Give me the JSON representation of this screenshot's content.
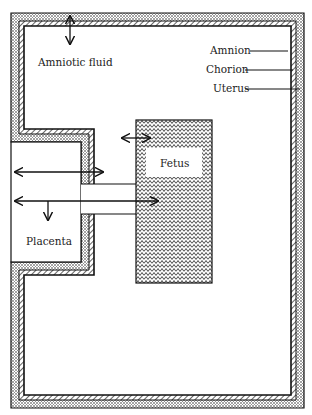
{
  "diagram": {
    "type": "schematic",
    "colors": {
      "background": "#ffffff",
      "line": "#111111",
      "uterus_fill": "stipple",
      "chorion_fill": "diagonal-hatch",
      "fetus_fill": "zigzag-hatch"
    },
    "labels": {
      "amniotic_fluid": "Amniotic fluid",
      "amnion": "Amnion",
      "chorion": "Chorion",
      "uterus": "Uterus",
      "fetus": "Fetus",
      "placenta": "Placenta"
    },
    "arrows": [
      {
        "id": "fluid-exchange",
        "type": "double",
        "direction": "vertical",
        "between": [
          "Uterus wall",
          "Amniotic fluid"
        ]
      },
      {
        "id": "fetus-fluid",
        "type": "double",
        "direction": "horizontal",
        "between": [
          "Amniotic fluid",
          "Fetus"
        ]
      },
      {
        "id": "placenta-fluid",
        "type": "double",
        "direction": "horizontal",
        "between": [
          "Placenta",
          "Amniotic fluid"
        ]
      },
      {
        "id": "placenta-fetus",
        "type": "double",
        "direction": "horizontal",
        "between": [
          "Placenta",
          "Fetus"
        ]
      },
      {
        "id": "placenta-down",
        "type": "single",
        "direction": "down",
        "between": [
          "Umbilical cord",
          "Placenta"
        ]
      }
    ]
  }
}
